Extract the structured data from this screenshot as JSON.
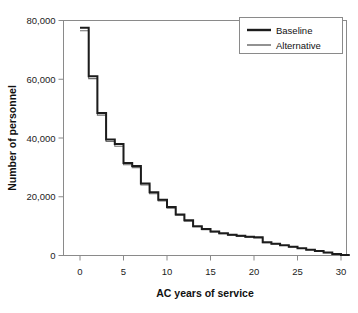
{
  "chart_data": {
    "type": "line",
    "subtype": "step",
    "title": "",
    "xlabel": "AC years of service",
    "ylabel": "Number of personnel",
    "xlim": [
      0,
      31
    ],
    "ylim": [
      0,
      80000
    ],
    "xticks": [
      0,
      5,
      10,
      15,
      20,
      25,
      30
    ],
    "xticklabels": [
      "0",
      "5",
      "10",
      "15",
      "20",
      "25",
      "30"
    ],
    "yticks": [
      0,
      20000,
      40000,
      60000,
      80000
    ],
    "yticklabels": [
      "0",
      "20,000",
      "40,000",
      "60,000",
      "80,000"
    ],
    "grid": false,
    "legend_position": "top-right",
    "x": [
      0,
      1,
      2,
      3,
      4,
      5,
      6,
      7,
      8,
      9,
      10,
      11,
      12,
      13,
      14,
      15,
      16,
      17,
      18,
      19,
      20,
      21,
      22,
      23,
      24,
      25,
      26,
      27,
      28,
      29,
      30
    ],
    "series": [
      {
        "name": "Baseline",
        "color": "#1c1c1c",
        "width": 2.0,
        "values": [
          77500,
          61000,
          48500,
          39500,
          38000,
          31500,
          30500,
          24500,
          21500,
          19000,
          16500,
          14000,
          12000,
          10000,
          9000,
          8200,
          7600,
          7100,
          6700,
          6400,
          6200,
          4500,
          4000,
          3500,
          3000,
          2500,
          2000,
          1500,
          1000,
          500,
          150
        ]
      },
      {
        "name": "Alternative",
        "color": "#6e6e6e",
        "width": 1.1,
        "values": [
          76500,
          60200,
          47800,
          38800,
          37200,
          30900,
          29900,
          24000,
          21000,
          18600,
          16100,
          13700,
          11700,
          9800,
          8800,
          8000,
          7400,
          6900,
          6500,
          6200,
          6000,
          4400,
          3900,
          3400,
          2900,
          2400,
          1950,
          1450,
          950,
          480,
          140
        ]
      }
    ]
  },
  "legend": {
    "items": [
      {
        "label": "Baseline"
      },
      {
        "label": "Alternative"
      }
    ]
  },
  "colors": {
    "baseline": "#1c1c1c",
    "alternative": "#6e6e6e",
    "frame": "#8a8a8a",
    "text": "#111111",
    "background": "#ffffff"
  }
}
